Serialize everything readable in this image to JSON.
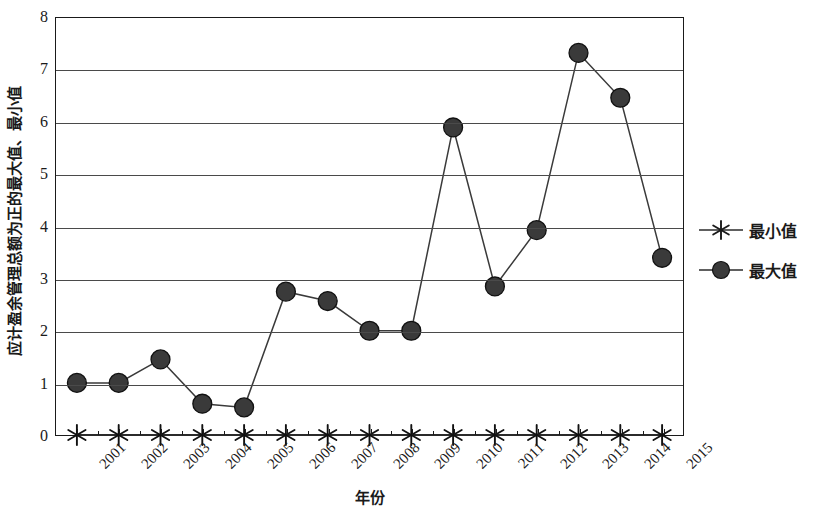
{
  "chart_data": {
    "type": "line",
    "title": "",
    "xlabel": "年份",
    "ylabel": "应计盈余管理总额为正的最大值、最小值",
    "categories": [
      "2001",
      "2002",
      "2003",
      "2004",
      "2005",
      "2006",
      "2007",
      "2008",
      "2009",
      "2010",
      "2011",
      "2012",
      "2013",
      "2014",
      "2015"
    ],
    "x": [
      2001,
      2002,
      2003,
      2004,
      2005,
      2006,
      2007,
      2008,
      2009,
      2010,
      2011,
      2012,
      2013,
      2014,
      2015
    ],
    "series": [
      {
        "name": "最小值",
        "marker": "asterisk",
        "color": "#2b2b2b",
        "values": [
          0,
          0,
          0,
          0,
          0,
          0,
          0,
          0,
          0,
          0,
          0,
          0,
          0,
          0,
          0
        ]
      },
      {
        "name": "最大值",
        "marker": "circle",
        "color": "#3a3a3a",
        "values": [
          1.0,
          1.0,
          1.45,
          0.6,
          0.53,
          2.75,
          2.57,
          2.0,
          2.0,
          5.9,
          2.85,
          3.93,
          7.33,
          6.47,
          3.4
        ]
      }
    ],
    "ylim": [
      0,
      8
    ],
    "yticks": [
      0,
      1,
      2,
      3,
      4,
      5,
      6,
      7,
      8
    ],
    "ytick_labels": [
      "0",
      "1",
      "2",
      "3",
      "4",
      "5",
      "6",
      "7",
      "8"
    ],
    "grid": "horizontal",
    "legend_position": "right",
    "legend_entries": [
      "最小值",
      "最大值"
    ],
    "axis_color": "#1a1a1a",
    "grid_color": "#4a4a4a",
    "background": "#ffffff"
  }
}
